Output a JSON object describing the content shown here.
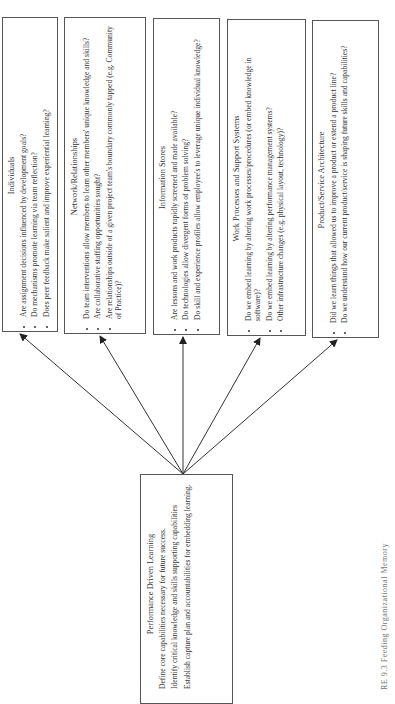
{
  "figure": {
    "caption": "RE 9.3 Feeding Organizational Memory"
  },
  "source_box": {
    "title": "Performance Driven Learning",
    "items": [
      "Define core capabilities necessary for future success.",
      "Identify critical knowledge and skills supporting capabilities",
      "Establish capture plan and accountabilities for embedding learning."
    ]
  },
  "targets": [
    {
      "title": "Individuals",
      "items": [
        "Are assignment decisions influenced by development goals?",
        "Do mechanisms promote learning via team reflection?",
        "Does peer feedback make salient and improve experiential learning?"
      ]
    },
    {
      "title": "Network/Relationships",
      "items": [
        "Do team interventions allow members to learn other members' unique knowledge and skills?",
        "Are collaborative staffing opportunities sought?",
        "Are relationships outside of a given project team's boundary commonly tapped (e.g. Community of Practice)?"
      ]
    },
    {
      "title": "Information Stores",
      "items": [
        "Are lessons and work products rapidly screened and made available?",
        "Do technologies allow divergent forms of problem solving?",
        "Do skill and experience profiles allow employee's to leverage unique individual knowledge?"
      ]
    },
    {
      "title": "Work Processes and Support Systems",
      "items": [
        "Do we embed learning by altering work processes/procedures (or embed knowledge in software)?",
        "Do we embed learning by altering performance management systems?",
        "Other infrastructure changes (e.g. physical layout, technology)?"
      ]
    },
    {
      "title": "Product/Service Architecture",
      "items": [
        "Did we learn things that allowed us to improve a product or extend a product line?",
        "Do we understand how our current product/service is shaping future skills and capabilities?"
      ]
    }
  ]
}
